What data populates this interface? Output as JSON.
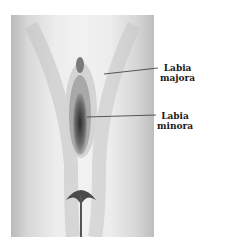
{
  "figure": {
    "labels": [
      {
        "line1": "Labia",
        "line2": "majora"
      },
      {
        "line1": "Labia",
        "line2": "minora"
      }
    ]
  }
}
